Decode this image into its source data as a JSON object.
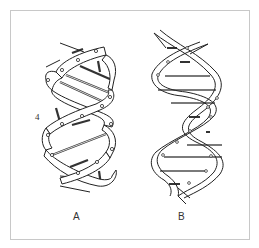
{
  "figure": {
    "panels": [
      {
        "id": "A",
        "label": "A",
        "annotation": "4",
        "description": "Double helix model with wide ribbon strands and rods"
      },
      {
        "id": "B",
        "label": "B",
        "description": "Double helix model with narrower ribbon strands and horizontal base-pair rods"
      }
    ]
  }
}
